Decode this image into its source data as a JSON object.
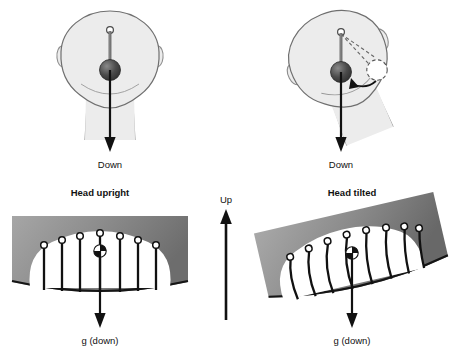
{
  "figure": {
    "background_color": "#ffffff",
    "width": 451,
    "height": 357
  },
  "palette": {
    "head_fill": "#ececec",
    "head_outline": "#6f6f6f",
    "pendulum_rod": "#6b6b6b",
    "pendulum_ball_dark": "#3a3a3a",
    "pendulum_ball_light": "#777777",
    "arrow_black": "#111111",
    "macula_gray_light": "#9d9d9d",
    "macula_gray_dark": "#6a6a6a",
    "otolith_membrane_fill": "#ffffff",
    "hair_cell_line": "#111111",
    "hair_cell_tip": "#ffffff",
    "text_color": "#111111"
  },
  "panels": {
    "top_left": {
      "name": "head-upright-pendulum",
      "caption": "Down",
      "head_rotation_deg": 0,
      "pendulum": {
        "state": "hanging vertical",
        "dashed_reference": false,
        "rotation_arrow": false
      }
    },
    "top_right": {
      "name": "head-tilted-pendulum",
      "caption": "Down",
      "head_rotation_deg": -22,
      "pendulum": {
        "state": "hangs vertical while head rotates",
        "dashed_reference": true,
        "rotation_arrow": true
      }
    },
    "bottom_left": {
      "name": "otolith-head-upright",
      "title": "Head upright",
      "caption": "g (down)",
      "macula_rotation_deg": 0,
      "hair_cell_count": 7,
      "hair_cells_bent": false
    },
    "bottom_right": {
      "name": "otolith-head-tilted",
      "title": "Head tilted",
      "caption": "g (down)",
      "macula_rotation_deg": -13,
      "hair_cell_count": 8,
      "hair_cells_bent": true
    },
    "center": {
      "name": "up-reference-arrow",
      "label": "Up",
      "direction": "up"
    }
  },
  "labels": {
    "down_left": "Down",
    "down_right": "Down",
    "head_upright": "Head upright",
    "head_tilted": "Head tilted",
    "g_down_left": "g (down)",
    "g_down_right": "g (down)",
    "up": "Up"
  }
}
